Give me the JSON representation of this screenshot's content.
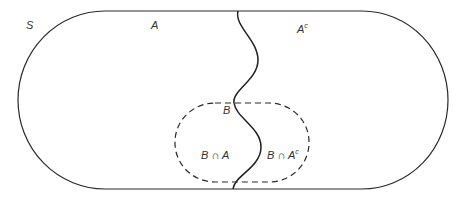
{
  "diagram": {
    "type": "venn-partition",
    "colors": {
      "stroke": "#2a2a2a",
      "text": "#333333",
      "background": "#ffffff"
    },
    "labels": {
      "universe": "S",
      "set_a": "A",
      "complement_base": "A",
      "complement_sup": "c",
      "set_b": "B",
      "b_and_a": "B ∩ A",
      "b_and_ac_base": "B ∩ A",
      "b_and_ac_sup": "c"
    },
    "regions": [
      {
        "id": "S",
        "description": "sample space (rounded outer boundary)",
        "style": "solid"
      },
      {
        "id": "A",
        "description": "left part of S",
        "style": "solid wavy divider"
      },
      {
        "id": "A^c",
        "description": "right part of S",
        "style": "solid wavy divider"
      },
      {
        "id": "B",
        "description": "event B",
        "style": "dashed"
      }
    ]
  }
}
